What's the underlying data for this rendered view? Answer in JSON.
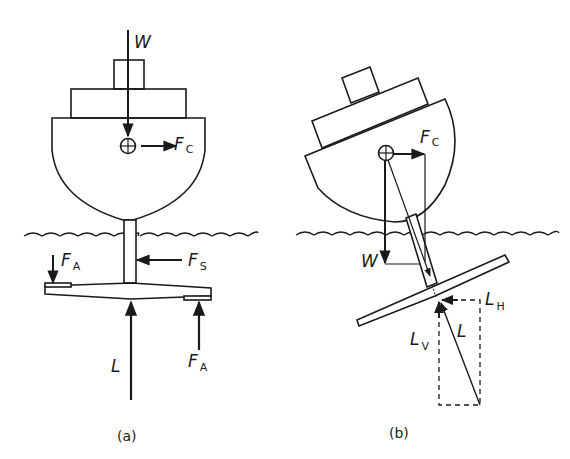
{
  "figure": {
    "panels": [
      {
        "id": "a",
        "caption": "(a)",
        "description": "Hydrofoil boat upright with vertical strut and foil with ailerons",
        "labels": {
          "weight": {
            "main": "W",
            "sub": ""
          },
          "centrifugal": {
            "main": "F",
            "sub": "C"
          },
          "aileron_left": {
            "main": "F",
            "sub": "A"
          },
          "side_force": {
            "main": "F",
            "sub": "S"
          },
          "lift": {
            "main": "L",
            "sub": ""
          },
          "aileron_right": {
            "main": "F",
            "sub": "A"
          }
        }
      },
      {
        "id": "b",
        "caption": "(b)",
        "description": "Hydrofoil boat banked in a turn with lift resolved into components",
        "labels": {
          "centrifugal": {
            "main": "F",
            "sub": "C"
          },
          "weight": {
            "main": "W",
            "sub": ""
          },
          "lift_horizontal": {
            "main": "L",
            "sub": "H"
          },
          "lift_vertical": {
            "main": "L",
            "sub": "V"
          },
          "lift": {
            "main": "L",
            "sub": ""
          }
        }
      }
    ],
    "colors": {
      "ink": "#1a1a1a",
      "background": "#ffffff"
    }
  }
}
